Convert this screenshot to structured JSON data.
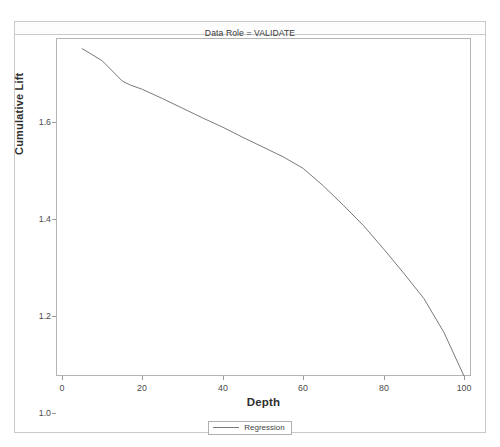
{
  "title": "Data Role = VALIDATE",
  "axes": {
    "xlabel": "Depth",
    "ylabel": "Cumulative Lift",
    "xticks": [
      "0",
      "20",
      "40",
      "60",
      "80",
      "100"
    ],
    "yticks": [
      "1.0",
      "1.2",
      "1.4",
      "1.6"
    ]
  },
  "legend": {
    "entries": [
      {
        "label": "Regression",
        "color": "#7a7a7a"
      }
    ]
  },
  "chart_data": {
    "type": "line",
    "title": "Data Role = VALIDATE",
    "xlabel": "Depth",
    "ylabel": "Cumulative Lift",
    "xlim": [
      0,
      103
    ],
    "ylim": [
      0.96,
      1.7
    ],
    "xticks": [
      0,
      20,
      40,
      60,
      80,
      100
    ],
    "yticks": [
      1.0,
      1.2,
      1.4,
      1.6
    ],
    "grid": false,
    "legend_position": "bottom-center",
    "series": [
      {
        "name": "Regression",
        "color": "#7a7a7a",
        "x": [
          5,
          10,
          15,
          17,
          20,
          25,
          30,
          35,
          40,
          45,
          50,
          55,
          60,
          65,
          70,
          75,
          80,
          85,
          90,
          95,
          100
        ],
        "y": [
          1.675,
          1.65,
          1.608,
          1.6,
          1.591,
          1.572,
          1.552,
          1.532,
          1.513,
          1.492,
          1.472,
          1.452,
          1.428,
          1.392,
          1.352,
          1.31,
          1.262,
          1.212,
          1.16,
          1.09,
          1.0
        ]
      }
    ]
  }
}
